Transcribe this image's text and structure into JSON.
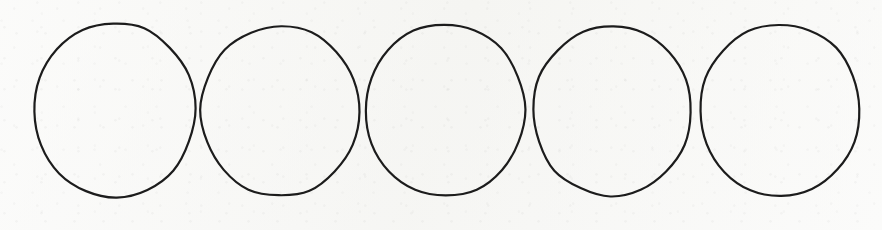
{
  "figure": {
    "medium": "pen on paper",
    "caption": "",
    "background_color": "#f7f7f5",
    "stroke_color": "#1c1c1c",
    "stroke_width": 2.2,
    "canvas": {
      "width": 882,
      "height": 230
    },
    "shape_count": 5,
    "shape_kind": "circle",
    "shapes": [
      {
        "id": "circle-1",
        "label": "Circle 1",
        "cx": 115,
        "cy": 110,
        "rx": 80,
        "ry": 87,
        "rotation": -1.2
      },
      {
        "id": "circle-2",
        "label": "Circle 2",
        "cx": 280,
        "cy": 111,
        "rx": 79,
        "ry": 85,
        "rotation": 0.8
      },
      {
        "id": "circle-3",
        "label": "Circle 3",
        "cx": 445,
        "cy": 110,
        "rx": 80,
        "ry": 86,
        "rotation": -0.6
      },
      {
        "id": "circle-4",
        "label": "Circle 4",
        "cx": 612,
        "cy": 111,
        "rx": 79,
        "ry": 85,
        "rotation": 1.1
      },
      {
        "id": "circle-5",
        "label": "Circle 5",
        "cx": 780,
        "cy": 110,
        "rx": 80,
        "ry": 86,
        "rotation": -0.9
      }
    ],
    "intersections": [
      {
        "id": "intersection-1-2",
        "x": 194,
        "y": 113
      },
      {
        "id": "intersection-2-3",
        "x": 357,
        "y": 113
      },
      {
        "id": "intersection-3-4",
        "x": 527,
        "y": 113
      },
      {
        "id": "intersection-4-5",
        "x": 696,
        "y": 113
      }
    ]
  }
}
